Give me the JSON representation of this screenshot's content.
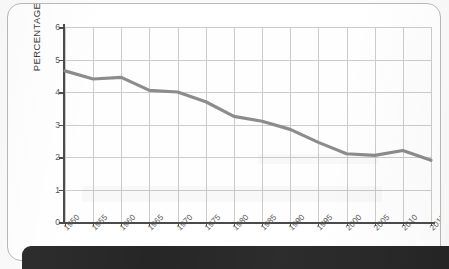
{
  "chart_data": {
    "type": "line",
    "title": "",
    "xlabel": "",
    "ylabel": "PERCENTAGE",
    "x": [
      1950,
      1955,
      1960,
      1965,
      1970,
      1975,
      1980,
      1985,
      1990,
      1995,
      2000,
      2005,
      2010,
      2015
    ],
    "categories": [
      "1950",
      "1955",
      "1960",
      "1965",
      "1970",
      "1975",
      "1980",
      "1985",
      "1990",
      "1995",
      "2000",
      "2005",
      "2010",
      "2015"
    ],
    "values": [
      4.65,
      4.4,
      4.45,
      4.05,
      4.0,
      3.7,
      3.25,
      3.1,
      2.85,
      2.45,
      2.1,
      2.05,
      2.2,
      1.9
    ],
    "series": [
      {
        "name": "percentage",
        "values": [
          4.65,
          4.4,
          4.45,
          4.05,
          4.0,
          3.7,
          3.25,
          3.1,
          2.85,
          2.45,
          2.1,
          2.05,
          2.2,
          1.9
        ],
        "color": "#8c8c8c"
      }
    ],
    "ylim": [
      0,
      6
    ],
    "xlim": [
      1950,
      2015
    ],
    "yticks": [
      "0",
      "1",
      "2",
      "3",
      "4",
      "5",
      "6"
    ],
    "ytick_values": [
      0,
      1,
      2,
      3,
      4,
      5,
      6
    ],
    "grid": true,
    "legend": false,
    "legend_position": "none",
    "line_color": "#8c8c8c",
    "grid_color": "#cccccc",
    "axis_color": "#4b4b4b",
    "xtick_rotation": -45
  },
  "card": {
    "background": "#ffffff",
    "border_color": "#b9b9b9"
  },
  "bottom_bar": {
    "color": "#262626",
    "label": ""
  }
}
